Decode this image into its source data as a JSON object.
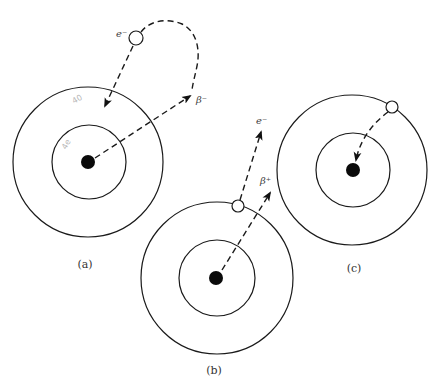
{
  "figure": {
    "panels": [
      {
        "id": "a",
        "caption": "(a)",
        "description": "Electron capture / beta-minus emission",
        "center": [
          88,
          162
        ],
        "outer_radius": 75,
        "inner_radius": 37,
        "nucleus_radius": 7,
        "vacancy": [
          136,
          38
        ],
        "labels": {
          "electron": "e⁻",
          "beta": "β⁻"
        },
        "pencil_marks": [
          "40",
          "4e"
        ]
      },
      {
        "id": "b",
        "caption": "(b)",
        "description": "Beta-plus emission with electron ejection",
        "center": [
          217,
          278
        ],
        "outer_radius": 76,
        "inner_radius": 38,
        "nucleus_radius": 7,
        "vacancy": [
          238,
          206
        ],
        "labels": {
          "electron": "e⁻",
          "beta": "β⁺"
        }
      },
      {
        "id": "c",
        "caption": "(c)",
        "description": "Electron capture from outer orbit",
        "center": [
          352,
          170
        ],
        "outer_radius": 75,
        "inner_radius": 37,
        "nucleus_radius": 7,
        "vacancy": [
          392,
          107
        ]
      }
    ]
  }
}
